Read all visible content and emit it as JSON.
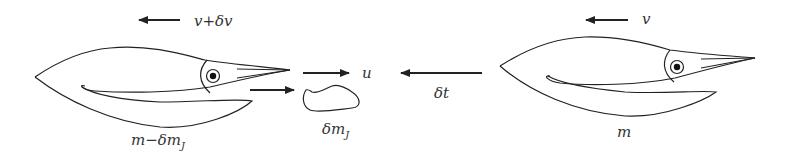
{
  "diagram": {
    "colors": {
      "stroke": "#222222",
      "text": "#333333",
      "background": "#ffffff"
    },
    "before_state": {
      "velocity_label": "v",
      "mass_label": "m"
    },
    "after_state": {
      "velocity_label": "v+δv",
      "mass_label": "m−δm",
      "mass_subscript": "J"
    },
    "ejected_mass": {
      "velocity_label": "u",
      "mass_label": "δm",
      "mass_subscript": "J"
    },
    "time_step": {
      "label": "δt"
    }
  }
}
